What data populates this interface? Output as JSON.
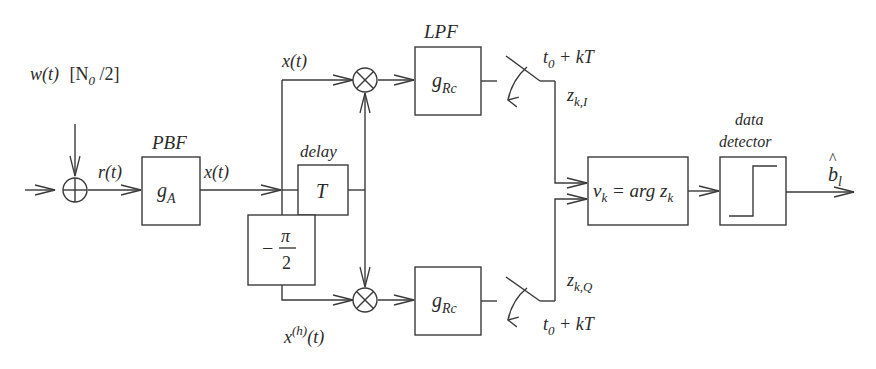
{
  "diagram": {
    "type": "block-diagram",
    "noise": {
      "label": "w(t)",
      "psd": "[N0/2]",
      "psd_base": "[N",
      "psd_sub": "0",
      "psd_tail": " /2]"
    },
    "adder": {
      "symbol": "+"
    },
    "received_signal": "r(t)",
    "pbf": {
      "title": "PBF",
      "content_base": "g",
      "content_sub": "A",
      "output": "x(t)"
    },
    "delay": {
      "title": "delay",
      "content": "T"
    },
    "phase_shift": {
      "content_minus": "−",
      "content_num": "π",
      "content_den": "2"
    },
    "upper_branch": {
      "input_label": "x(t)",
      "mixer": "×",
      "lpf_title": "LPF",
      "lpf_base": "g",
      "lpf_sub": "Rc",
      "sample_time_base": "t",
      "sample_time_sub": "0",
      "sample_time_tail": " + kT",
      "output_base": "z",
      "output_sub": "k,I"
    },
    "lower_branch": {
      "input_base": "x",
      "input_sup": "(h)",
      "input_tail": "(t)",
      "mixer": "×",
      "lpf_base": "g",
      "lpf_sub": "Rc",
      "sample_time_base": "t",
      "sample_time_sub": "0",
      "sample_time_tail": " + kT",
      "output_base": "z",
      "output_sub": "k,Q"
    },
    "arg_block": {
      "v_base": "v",
      "v_sub": "k",
      "eq": " = arg ",
      "z_base": "z",
      "z_sub": "k"
    },
    "detector": {
      "title_line1": "data",
      "title_line2": "detector"
    },
    "output": {
      "base": "b",
      "hat": "^",
      "sub": "l"
    }
  }
}
